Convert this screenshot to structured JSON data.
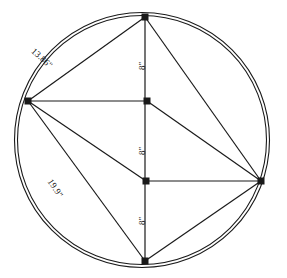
{
  "figure": {
    "type": "geometry-diagram",
    "stroke_color": "#1a1a1a",
    "background_color": "#ffffff",
    "circle": {
      "center_x": 142,
      "center_y": 140,
      "radius": 126,
      "double_outline": true
    },
    "vertices": [
      {
        "name": "top",
        "x": 145,
        "y": 17
      },
      {
        "name": "left",
        "x": 28,
        "y": 101
      },
      {
        "name": "right",
        "x": 261,
        "y": 181
      },
      {
        "name": "bottom",
        "x": 145,
        "y": 261
      }
    ],
    "interior_points": [
      {
        "name": "upper-mid",
        "x": 147,
        "y": 101
      },
      {
        "name": "lower-mid",
        "x": 146,
        "y": 181
      }
    ],
    "segments": [
      {
        "name": "top-to-left-chord",
        "from": "top",
        "to": "left"
      },
      {
        "name": "left-to-bottom-chord",
        "from": "left",
        "to": "bottom"
      },
      {
        "name": "bottom-to-right-chord",
        "from": "bottom",
        "to": "right"
      },
      {
        "name": "right-to-top-chord",
        "from": "right",
        "to": "top"
      },
      {
        "name": "vertical-axis",
        "from": "top",
        "to": "bottom"
      },
      {
        "name": "upper-horizontal",
        "from": "left",
        "to": "upper-mid"
      },
      {
        "name": "lower-horizontal",
        "from": "lower-mid",
        "to": "right"
      },
      {
        "name": "left-to-lower-mid-diagonal",
        "from": "left",
        "to": "lower-mid"
      },
      {
        "name": "upper-mid-to-right-diagonal",
        "from": "upper-mid",
        "to": "right"
      }
    ],
    "labels": {
      "chord_upper_left": "13.86\"",
      "chord_lower_left": "19.9\"",
      "vertical_top": "8\"",
      "vertical_middle": "8\"",
      "vertical_bottom": "8\""
    }
  }
}
